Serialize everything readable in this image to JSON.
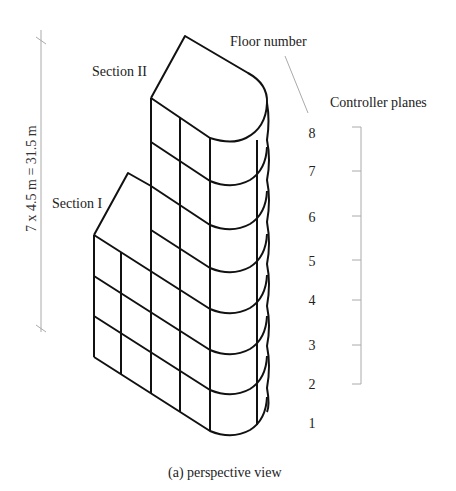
{
  "figure": {
    "caption": "(a) perspective view",
    "dimension_label": "7 x 4.5 m = 31.5 m",
    "section_labels": [
      "Section II",
      "Section I"
    ],
    "floor_number_title": "Floor number",
    "controller_planes_title": "Controller planes",
    "floor_numbers": [
      "8",
      "7",
      "6",
      "5",
      "4",
      "3",
      "2",
      "1"
    ],
    "colors": {
      "structure": "#111111",
      "annotation": "#aaaaaa",
      "text": "#222222"
    }
  }
}
